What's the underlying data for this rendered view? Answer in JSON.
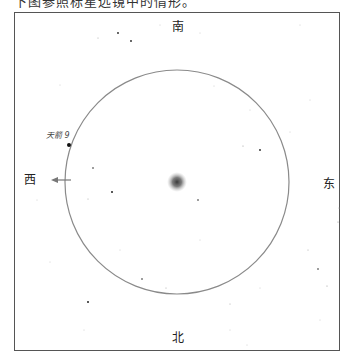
{
  "caption": "下图参照标星远镜中的情形。",
  "compass": {
    "north": "北",
    "south": "南",
    "east": "东",
    "west": "西"
  },
  "labeled_star": {
    "name": "天箭 9",
    "x": 69,
    "y": 145
  },
  "field_of_view": {
    "cx": 177,
    "cy": 182,
    "r": 112,
    "stroke": "#8a8a8a"
  },
  "target_object": {
    "cx": 177,
    "cy": 182,
    "r": 10,
    "color": "#444444"
  },
  "direction_arrow": {
    "from_x": 71,
    "to_x": 51,
    "y": 180,
    "points_to": "西"
  },
  "field_stars": [
    {
      "x": 118,
      "y": 33,
      "r": 0.9
    },
    {
      "x": 131,
      "y": 41,
      "r": 0.9
    },
    {
      "x": 98,
      "y": 38,
      "r": 0.5
    },
    {
      "x": 160,
      "y": 25,
      "r": 0.4
    },
    {
      "x": 200,
      "y": 33,
      "r": 0.4
    },
    {
      "x": 300,
      "y": 25,
      "r": 0.4
    },
    {
      "x": 260,
      "y": 150,
      "r": 0.9
    },
    {
      "x": 243,
      "y": 146,
      "r": 0.6
    },
    {
      "x": 93,
      "y": 168,
      "r": 0.8
    },
    {
      "x": 112,
      "y": 192,
      "r": 1.0
    },
    {
      "x": 88,
      "y": 199,
      "r": 0.5
    },
    {
      "x": 142,
      "y": 279,
      "r": 0.8
    },
    {
      "x": 166,
      "y": 288,
      "r": 0.5
    },
    {
      "x": 88,
      "y": 302,
      "r": 1.0
    },
    {
      "x": 198,
      "y": 200,
      "r": 0.8
    },
    {
      "x": 318,
      "y": 269,
      "r": 0.8
    },
    {
      "x": 327,
      "y": 286,
      "r": 0.6
    },
    {
      "x": 338,
      "y": 222,
      "r": 0.6
    },
    {
      "x": 230,
      "y": 304,
      "r": 0.5
    },
    {
      "x": 260,
      "y": 288,
      "r": 0.4
    },
    {
      "x": 308,
      "y": 250,
      "r": 0.5
    },
    {
      "x": 339,
      "y": 208,
      "r": 0.5
    },
    {
      "x": 320,
      "y": 320,
      "r": 0.4
    },
    {
      "x": 60,
      "y": 85,
      "r": 0.4
    },
    {
      "x": 37,
      "y": 200,
      "r": 0.4
    },
    {
      "x": 50,
      "y": 262,
      "r": 0.4
    },
    {
      "x": 250,
      "y": 110,
      "r": 0.4
    },
    {
      "x": 214,
      "y": 86,
      "r": 0.4
    },
    {
      "x": 290,
      "y": 132,
      "r": 0.4
    },
    {
      "x": 310,
      "y": 100,
      "r": 0.4
    },
    {
      "x": 120,
      "y": 250,
      "r": 0.4
    },
    {
      "x": 200,
      "y": 240,
      "r": 0.4
    },
    {
      "x": 230,
      "y": 330,
      "r": 0.4
    },
    {
      "x": 84,
      "y": 330,
      "r": 0.4
    },
    {
      "x": 247,
      "y": 345,
      "r": 0.4
    }
  ]
}
